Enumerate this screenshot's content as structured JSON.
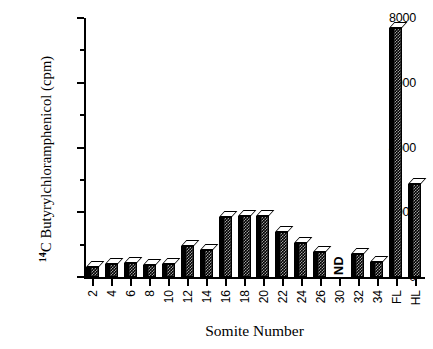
{
  "chart_data": {
    "type": "bar",
    "title": "",
    "xlabel": "Somite Number",
    "ylabel": "14C Butyrylchloramphenicol (cpm)",
    "ylabel_superscript": "14",
    "ylabel_rest": "C Butyrylchloramphenicol (cpm)",
    "categories": [
      "2",
      "4",
      "6",
      "8",
      "10",
      "12",
      "14",
      "16",
      "18",
      "20",
      "22",
      "24",
      "26",
      "30",
      "32",
      "34",
      "FL",
      "HL"
    ],
    "values": [
      300,
      400,
      430,
      380,
      400,
      950,
      820,
      1850,
      1880,
      1900,
      1400,
      1060,
      760,
      null,
      700,
      450,
      7700,
      2880
    ],
    "annotations": [
      {
        "category": "30",
        "text": "ND"
      }
    ],
    "ylim": [
      0,
      8000
    ],
    "yticks": [
      0,
      2000,
      4000,
      6000,
      8000
    ],
    "yticklabels": [
      "0",
      "2000",
      "4000",
      "6000",
      "8000"
    ],
    "yminorticks": [
      1000,
      3000,
      5000,
      7000
    ],
    "grid": false,
    "legend": false,
    "bar_style": "3d-hatched",
    "bar_color": "#000000"
  }
}
